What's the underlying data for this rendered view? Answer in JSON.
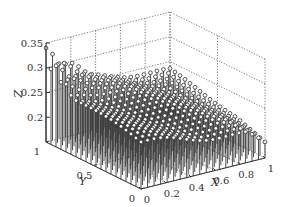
{
  "chart_data": {
    "type": "3d-stem",
    "title": "",
    "xlabel": "X",
    "ylabel": "Y",
    "zlabel": "Z",
    "xlim": [
      0,
      1
    ],
    "ylim": [
      0,
      1
    ],
    "zlim": [
      0.15,
      0.35
    ],
    "x_ticks": [
      "0",
      "0.2",
      "0.4",
      "0.6",
      "0.8",
      "1"
    ],
    "y_ticks": [
      "0",
      "0.5",
      "1"
    ],
    "z_ticks": [
      "0.2",
      "0.25",
      "0.3",
      "0.35"
    ],
    "grid": true,
    "grid_style": "dotted",
    "marker": "open-circle",
    "grid_points_per_axis": 20,
    "surface_description": "Stems on a 20x20 grid over [0,1]x[0,1]; tops form a roughly planar surface rising from ~0.2 near (x=1,y=0) to ~0.35 near (x=0,y=1), with markers around z=0.25 at the left edge and taller spikes near the back corner (x=0..0.3, y=1).",
    "z_model": {
      "base": 0.245,
      "slope_x": -0.045,
      "slope_y": 0.03,
      "spike_zone": {
        "x_max": 0.35,
        "y_min": 0.7,
        "peak": 0.34
      }
    }
  },
  "axes": {
    "x_label": "X",
    "y_label": "Y",
    "z_label": "Z"
  }
}
